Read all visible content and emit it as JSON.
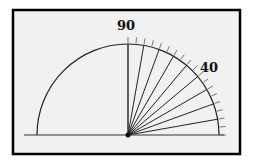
{
  "diagram": {
    "type": "protractor-rays",
    "labels": [
      {
        "text": "90",
        "angle": 90
      },
      {
        "text": "40",
        "angle": 40
      }
    ],
    "ray_angles": [
      10,
      20,
      30,
      40,
      50,
      60,
      70,
      80,
      90
    ],
    "tick_step_degrees": 5,
    "colors": {
      "background": "#f1f1f1",
      "frame": "#000000",
      "lines": "#222222",
      "ticks": "#666666"
    }
  }
}
